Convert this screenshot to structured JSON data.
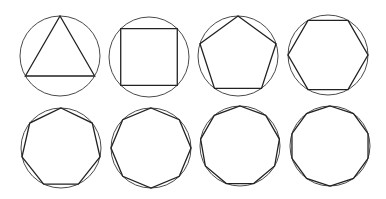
{
  "diagram": {
    "colors": {
      "background": "#ffffff",
      "circle_stroke": "#4a4a4a",
      "polygon_stroke": "#222222"
    },
    "figures": [
      {
        "name": "triangle",
        "sides": 3,
        "cx": 60,
        "cy": 56,
        "r": 40,
        "rotation_deg": -90
      },
      {
        "name": "square",
        "sides": 4,
        "cx": 149,
        "cy": 57,
        "r": 40,
        "rotation_deg": -135
      },
      {
        "name": "pentagon",
        "sides": 5,
        "cx": 238,
        "cy": 56,
        "r": 40,
        "rotation_deg": -90
      },
      {
        "name": "hexagon",
        "sides": 6,
        "cx": 328,
        "cy": 55,
        "r": 40,
        "rotation_deg": 0
      },
      {
        "name": "heptagon",
        "sides": 7,
        "cx": 61,
        "cy": 148,
        "r": 40,
        "rotation_deg": -90
      },
      {
        "name": "octagon",
        "sides": 8,
        "cx": 151,
        "cy": 148,
        "r": 40,
        "rotation_deg": -90
      },
      {
        "name": "nonagon",
        "sides": 9,
        "cx": 240,
        "cy": 146,
        "r": 40,
        "rotation_deg": -90
      },
      {
        "name": "decagon",
        "sides": 10,
        "cx": 330,
        "cy": 146,
        "r": 40,
        "rotation_deg": -90
      }
    ]
  }
}
